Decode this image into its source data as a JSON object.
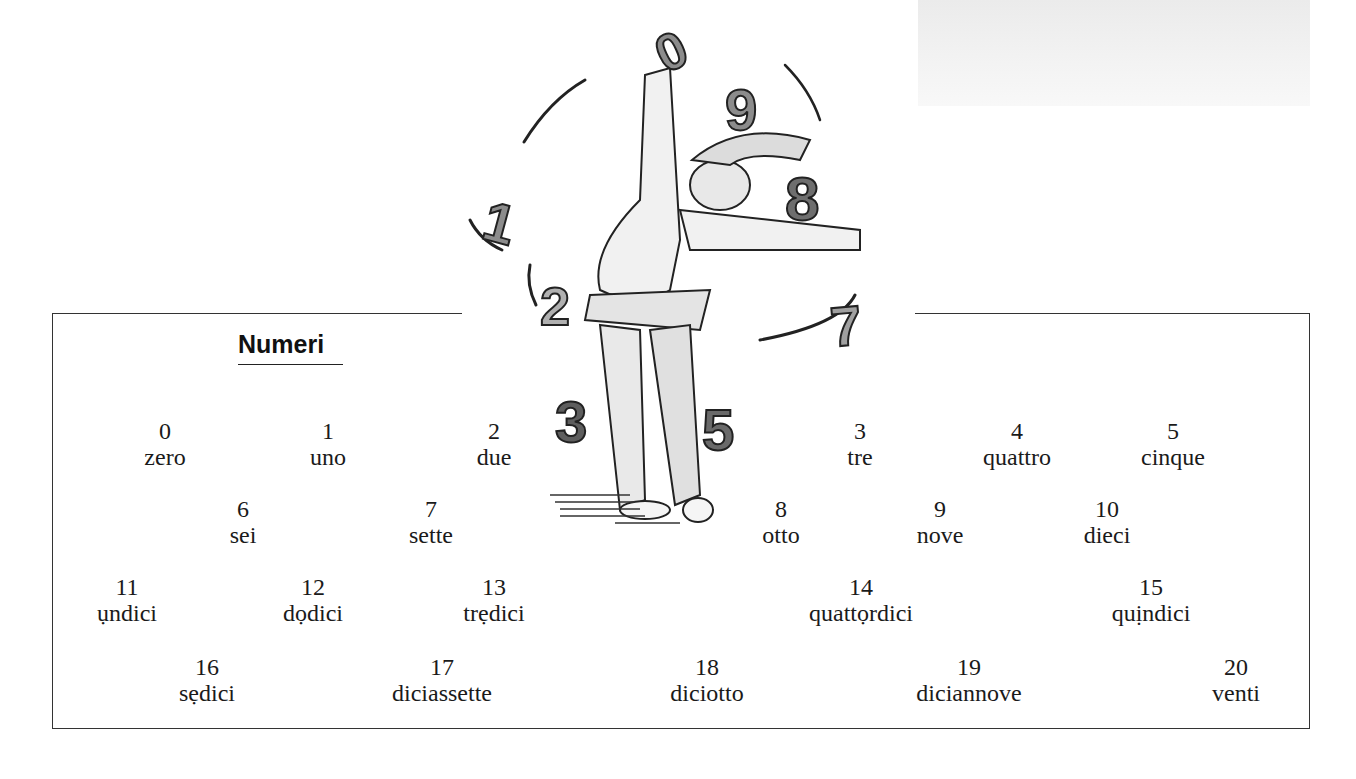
{
  "title": "Numeri",
  "numbers": [
    {
      "digit": "0",
      "word": "zero",
      "x": 165,
      "y": 418
    },
    {
      "digit": "1",
      "word": "uno",
      "x": 328,
      "y": 418
    },
    {
      "digit": "2",
      "word": "due",
      "x": 494,
      "y": 418
    },
    {
      "digit": "3",
      "word": "tre",
      "x": 860,
      "y": 418
    },
    {
      "digit": "4",
      "word": "quattro",
      "x": 1017,
      "y": 418
    },
    {
      "digit": "5",
      "word": "cinque",
      "x": 1173,
      "y": 418
    },
    {
      "digit": "6",
      "word": "sei",
      "x": 243,
      "y": 496
    },
    {
      "digit": "7",
      "word": "sette",
      "x": 431,
      "y": 496
    },
    {
      "digit": "8",
      "word": "otto",
      "x": 781,
      "y": 496
    },
    {
      "digit": "9",
      "word": "nove",
      "x": 940,
      "y": 496
    },
    {
      "digit": "10",
      "word": "dieci",
      "x": 1107,
      "y": 496
    },
    {
      "digit": "11",
      "word": "ụndici",
      "x": 127,
      "y": 574
    },
    {
      "digit": "12",
      "word": "dọdici",
      "x": 313,
      "y": 574
    },
    {
      "digit": "13",
      "word": "trẹdici",
      "x": 494,
      "y": 574
    },
    {
      "digit": "14",
      "word": "quattọrdici",
      "x": 861,
      "y": 574
    },
    {
      "digit": "15",
      "word": "quịndici",
      "x": 1151,
      "y": 574
    },
    {
      "digit": "16",
      "word": "sẹdici",
      "x": 207,
      "y": 654
    },
    {
      "digit": "17",
      "word": "diciassette",
      "x": 442,
      "y": 654
    },
    {
      "digit": "18",
      "word": "diciotto",
      "x": 707,
      "y": 654
    },
    {
      "digit": "19",
      "word": "diciannove",
      "x": 969,
      "y": 654
    },
    {
      "digit": "20",
      "word": "venti",
      "x": 1236,
      "y": 654
    }
  ],
  "illustration": {
    "subject": "jester juggling numbers",
    "juggled_numerals": [
      "0",
      "9",
      "8",
      "1",
      "2",
      "7",
      "3",
      "5"
    ]
  }
}
